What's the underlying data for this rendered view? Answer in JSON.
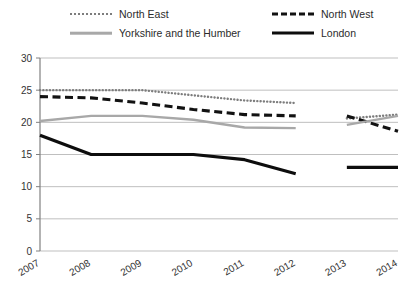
{
  "chart_data": {
    "type": "line",
    "title": "",
    "xlabel": "",
    "ylabel": "",
    "categories": [
      "2007",
      "2008",
      "2009",
      "2010",
      "2011",
      "2012",
      "2013",
      "2014"
    ],
    "ylim": [
      0,
      30
    ],
    "yticks": [
      0,
      5,
      10,
      15,
      20,
      25,
      30
    ],
    "grid": true,
    "legend_position": "top",
    "note": "All series are broken between 2012 and 2013",
    "series": [
      {
        "name": "North East",
        "style": "dotted",
        "color": "#7d7d7d",
        "x": [
          "2007",
          "2008",
          "2009",
          "2010",
          "2011",
          "2012"
        ],
        "values": [
          25.0,
          25.0,
          25.0,
          24.2,
          23.4,
          23.0
        ]
      },
      {
        "name": "North East",
        "style": "dotted",
        "color": "#7d7d7d",
        "segment": 2,
        "x": [
          "2013",
          "2014"
        ],
        "values": [
          20.6,
          21.2
        ]
      },
      {
        "name": "North West",
        "style": "dashed",
        "color": "#121212",
        "x": [
          "2007",
          "2008",
          "2009",
          "2010",
          "2011",
          "2012"
        ],
        "values": [
          24.0,
          23.8,
          23.0,
          22.0,
          21.2,
          21.0
        ]
      },
      {
        "name": "North West",
        "style": "dashed",
        "color": "#121212",
        "segment": 2,
        "x": [
          "2013",
          "2014"
        ],
        "values": [
          21.0,
          18.6
        ]
      },
      {
        "name": "Yorkshire and the Humber",
        "style": "solid",
        "color": "#a8a8a8",
        "x": [
          "2007",
          "2008",
          "2009",
          "2010",
          "2011",
          "2012"
        ],
        "values": [
          20.2,
          21.0,
          21.0,
          20.4,
          19.2,
          19.1
        ]
      },
      {
        "name": "Yorkshire and the Humber",
        "style": "solid",
        "color": "#a8a8a8",
        "segment": 2,
        "x": [
          "2013",
          "2014"
        ],
        "values": [
          19.6,
          21.0
        ]
      },
      {
        "name": "London",
        "style": "solid",
        "color": "#0d0d0d",
        "x": [
          "2007",
          "2008",
          "2009",
          "2010",
          "2011",
          "2012"
        ],
        "values": [
          18.0,
          15.0,
          15.0,
          15.0,
          14.2,
          12.0
        ]
      },
      {
        "name": "London",
        "style": "solid",
        "color": "#0d0d0d",
        "segment": 2,
        "x": [
          "2013",
          "2014"
        ],
        "values": [
          13.0,
          13.0
        ]
      }
    ]
  },
  "legend": {
    "items": [
      {
        "label": "North East",
        "swatch": "dotted-gray-line-swatch"
      },
      {
        "label": "North West",
        "swatch": "dashed-black-line-swatch"
      },
      {
        "label": "Yorkshire and the Humber",
        "swatch": "solid-gray-line-swatch"
      },
      {
        "label": "London",
        "swatch": "solid-black-line-swatch"
      }
    ]
  },
  "axes": {
    "y_labels": [
      "30",
      "25",
      "20",
      "15",
      "10",
      "5",
      "0"
    ],
    "x_labels": [
      "2007",
      "2008",
      "2009",
      "2010",
      "2011",
      "2012",
      "2013",
      "2014"
    ]
  },
  "colors": {
    "north_east": "#7d7d7d",
    "north_west": "#121212",
    "yorkshire": "#a8a8a8",
    "london": "#0d0d0d",
    "grid": "#bfbfbf",
    "axis": "#808080",
    "text": "#333333",
    "background": "#ffffff"
  }
}
